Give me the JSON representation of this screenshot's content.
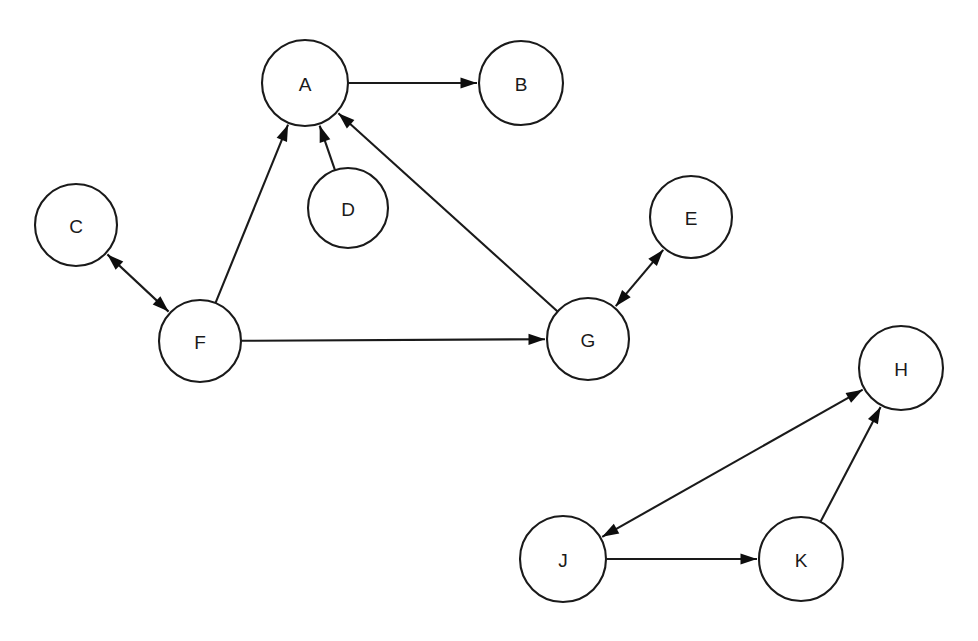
{
  "diagram": {
    "type": "directed-graph",
    "background_color": "#ffffff",
    "stroke_color": "#1a1a1a",
    "node_fill_color": "#ffffff",
    "arrow_color": "#0d0d0d",
    "width": 978,
    "height": 641,
    "nodes": [
      {
        "id": "A",
        "label": "A",
        "cx": 305,
        "cy": 83,
        "r": 43
      },
      {
        "id": "B",
        "label": "B",
        "cx": 521,
        "cy": 83,
        "r": 42
      },
      {
        "id": "C",
        "label": "C",
        "cx": 76,
        "cy": 225,
        "r": 41
      },
      {
        "id": "D",
        "label": "D",
        "cx": 348,
        "cy": 208,
        "r": 40
      },
      {
        "id": "E",
        "label": "E",
        "cx": 691,
        "cy": 217,
        "r": 41
      },
      {
        "id": "F",
        "label": "F",
        "cx": 200,
        "cy": 341,
        "r": 41
      },
      {
        "id": "G",
        "label": "G",
        "cx": 588,
        "cy": 339,
        "r": 41
      },
      {
        "id": "H",
        "label": "H",
        "cx": 901,
        "cy": 368,
        "r": 42
      },
      {
        "id": "J",
        "label": "J",
        "cx": 563,
        "cy": 559,
        "r": 43
      },
      {
        "id": "K",
        "label": "K",
        "cx": 801,
        "cy": 559,
        "r": 42
      }
    ],
    "edges": [
      {
        "id": "A-B",
        "from": "A",
        "to": "B",
        "direction": "forward",
        "label": "A to B"
      },
      {
        "id": "F-A",
        "from": "F",
        "to": "A",
        "direction": "forward",
        "label": "F to A"
      },
      {
        "id": "D-A",
        "from": "D",
        "to": "A",
        "direction": "forward",
        "label": "D to A"
      },
      {
        "id": "G-A",
        "from": "G",
        "to": "A",
        "direction": "forward",
        "label": "G to A"
      },
      {
        "id": "C-F",
        "from": "F",
        "to": "C",
        "direction": "bidirectional",
        "label": "C and F"
      },
      {
        "id": "F-G",
        "from": "F",
        "to": "G",
        "direction": "forward",
        "label": "F to G"
      },
      {
        "id": "G-E",
        "from": "G",
        "to": "E",
        "direction": "bidirectional",
        "label": "G and E"
      },
      {
        "id": "J-H",
        "from": "J",
        "to": "H",
        "direction": "bidirectional",
        "label": "J and H"
      },
      {
        "id": "K-H",
        "from": "K",
        "to": "H",
        "direction": "forward",
        "label": "K to H"
      },
      {
        "id": "J-K",
        "from": "J",
        "to": "K",
        "direction": "forward",
        "label": "J to K"
      }
    ],
    "components": [
      {
        "id": "component-1",
        "members": [
          "A",
          "B",
          "C",
          "D",
          "E",
          "F",
          "G"
        ]
      },
      {
        "id": "component-2",
        "members": [
          "H",
          "J",
          "K"
        ]
      }
    ]
  }
}
